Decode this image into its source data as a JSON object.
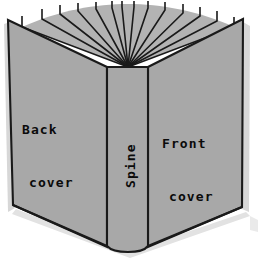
{
  "illustration": {
    "subject": "open-book-parts-diagram",
    "labels": {
      "back_cover_line1": "Back",
      "back_cover_line2": "cover",
      "spine": "Spine",
      "front_cover_line1": "Front",
      "front_cover_line2": "cover"
    },
    "colors": {
      "background": "#ffffff",
      "cover_fill": "#a8a8a8",
      "page_block_fill": "#b3b3b3",
      "spine_fill": "#a8a8a8",
      "outline": "#1a1a1a",
      "shadow": "#d5d5d5",
      "text": "#0b0b0b"
    },
    "geometry": {
      "back_cover_polygon": "8,20 107,67 107,247 13,205",
      "front_cover_polygon": "243,19 148,67 148,247 242,207",
      "spine_polygon": "107,67 148,67 148,247 107,247",
      "page_fan_apex": [
        128,
        67
      ],
      "page_tip_count": 14,
      "spine_bottom_curve_depth": 7
    },
    "page_tips": [
      [
        22,
        27
      ],
      [
        42,
        19
      ],
      [
        60,
        14
      ],
      [
        78,
        11
      ],
      [
        96,
        9
      ],
      [
        114,
        8
      ],
      [
        124,
        7
      ],
      [
        134,
        7
      ],
      [
        148,
        8
      ],
      [
        165,
        9
      ],
      [
        183,
        12
      ],
      [
        200,
        15
      ],
      [
        217,
        20
      ],
      [
        234,
        27
      ]
    ]
  }
}
